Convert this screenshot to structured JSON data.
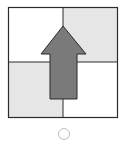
{
  "figure": {
    "grid": {
      "cells": [
        {
          "position": "top-left",
          "fill": "#ffffff"
        },
        {
          "position": "top-right",
          "fill": "#e6e6e6"
        },
        {
          "position": "bottom-left",
          "fill": "#e6e6e6"
        },
        {
          "position": "bottom-right",
          "fill": "#ffffff"
        }
      ],
      "line_color": "#2b2b2b"
    },
    "arrow": {
      "direction": "up",
      "fill": "#7a7a7a",
      "stroke": "#2b2b2b"
    },
    "option": {
      "shape": "circle",
      "selected": false,
      "stroke": "#bdbdbd"
    }
  }
}
